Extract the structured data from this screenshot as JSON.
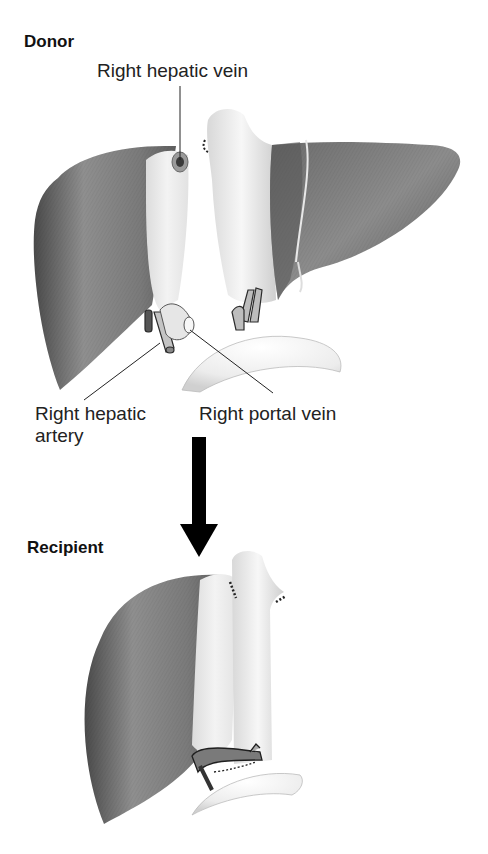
{
  "diagram": {
    "panels": [
      {
        "id": "donor",
        "title": "Donor",
        "labels": {
          "right_hepatic_vein": "Right hepatic vein",
          "right_hepatic_artery_line1": "Right hepatic",
          "right_hepatic_artery_line2": "artery",
          "right_portal_vein": "Right portal vein"
        }
      },
      {
        "id": "recipient",
        "title": "Recipient"
      }
    ],
    "arrow": {
      "direction": "down",
      "meaning": "transfer of right lobe graft from donor to recipient"
    },
    "colors": {
      "liver_dark": "#5a5a5a",
      "liver_mid": "#8a8a8a",
      "liver_light": "#b5b5b5",
      "cut_surface": "#e8e8e8",
      "vessel": "#f0f0f0",
      "vessel_outline": "#3a3a3a",
      "arrow": "#000000",
      "leader_line": "#222222",
      "text": "#1a1a1a"
    }
  }
}
